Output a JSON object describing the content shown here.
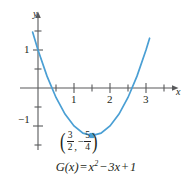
{
  "figure": {
    "type": "parabola-graph",
    "background": "#ffffff",
    "curve_color": "#4a9fd4",
    "axis_color": "#58595b",
    "text_color": "#231f20"
  },
  "axes": {
    "x_label": "x",
    "y_label": "y",
    "x_ticks": [
      {
        "value": 1,
        "label": "1"
      },
      {
        "value": 2,
        "label": "2"
      },
      {
        "value": 3,
        "label": "3"
      }
    ],
    "x_minor_ticks": [
      0.5,
      1.5,
      2.5,
      3.5
    ],
    "y_ticks": [
      {
        "value": 1,
        "label": "1"
      },
      {
        "value": -1,
        "label": "−1"
      }
    ],
    "y_minor_ticks": [
      0.5,
      1.5,
      2,
      -0.5,
      -1.5
    ],
    "xlim": [
      -0.25,
      3.85
    ],
    "ylim": [
      -1.85,
      2.1
    ],
    "grid": false
  },
  "vertex": {
    "x_num": "3",
    "x_den": "2",
    "y_sign": "−",
    "y_num": "5",
    "y_den": "4",
    "comma": ",",
    "open_paren": "(",
    "close_paren": ")",
    "marker": "square"
  },
  "equation": {
    "name": "G",
    "arg": "(x)",
    "equals": "=",
    "term1": "x",
    "exponent": "2",
    "op1": "−",
    "term2": "3x",
    "op2": "+",
    "term3": "1",
    "full": "G(x) = x² − 3x + 1"
  },
  "chart_data": {
    "type": "line",
    "title": "",
    "xlabel": "x",
    "ylabel": "y",
    "xlim": [
      -0.25,
      3.85
    ],
    "ylim": [
      -1.85,
      2.1
    ],
    "grid": false,
    "function": "G(x) = x^2 - 3x + 1",
    "series": [
      {
        "name": "G(x) = x² − 3x + 1",
        "color": "#4a9fd4",
        "x": [
          -0.15,
          0,
          0.25,
          0.5,
          0.75,
          1,
          1.25,
          1.5,
          1.75,
          2,
          2.25,
          2.5,
          2.75,
          3,
          3.1
        ],
        "y": [
          1.4725,
          1,
          0.3125,
          -0.25,
          -0.6875,
          -1,
          -1.1875,
          -1.25,
          -1.1875,
          -1,
          -0.6875,
          -0.25,
          0.3125,
          1,
          1.31
        ]
      }
    ],
    "annotations": [
      {
        "type": "point",
        "label": "(3/2, −5/4)",
        "x": 1.5,
        "y": -1.25,
        "marker": "square",
        "color": "#4a9fd4"
      }
    ],
    "x_tick_labels": [
      "1",
      "2",
      "3"
    ],
    "y_tick_labels": [
      "1",
      "−1"
    ]
  }
}
